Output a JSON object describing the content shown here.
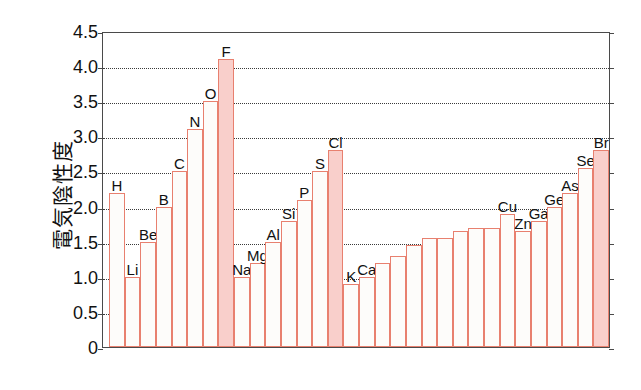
{
  "chart_data": {
    "type": "bar",
    "title": "",
    "xlabel": "",
    "ylabel": "電気陰性度",
    "ylim": [
      0,
      4.5
    ],
    "grid": true,
    "legend": "none",
    "y_ticks": [
      0,
      0.5,
      1.0,
      1.5,
      2.0,
      2.5,
      3.0,
      3.5,
      4.0,
      4.5
    ],
    "y_tick_labels": [
      "0",
      "0.5",
      "1.0",
      "1.5",
      "2.0",
      "2.5",
      "3.0",
      "3.5",
      "4.0",
      "4.5"
    ],
    "categories": [
      "H",
      "Li",
      "Be",
      "B",
      "C",
      "N",
      "O",
      "F",
      "Na",
      "Mg",
      "Al",
      "Si",
      "P",
      "S",
      "Cl",
      "K",
      "Ca",
      "Sc",
      "Ti",
      "V",
      "Cr",
      "Mn",
      "Fe",
      "Co",
      "Ni",
      "Cu",
      "Zn",
      "Ga",
      "Ge",
      "As",
      "Se",
      "Br"
    ],
    "values": [
      2.2,
      1.0,
      1.5,
      2.0,
      2.5,
      3.1,
      3.5,
      4.1,
      1.0,
      1.2,
      1.5,
      1.8,
      2.1,
      2.5,
      2.8,
      0.9,
      1.0,
      1.2,
      1.3,
      1.45,
      1.55,
      1.55,
      1.65,
      1.7,
      1.7,
      1.9,
      1.65,
      1.8,
      2.0,
      2.2,
      2.55,
      2.8
    ],
    "point_labels": [
      "H",
      "Li",
      "Be",
      "B",
      "C",
      "N",
      "O",
      "F",
      "Na",
      "Mg",
      "Al",
      "Si",
      "P",
      "S",
      "Cl",
      "K",
      "Ca",
      "",
      "",
      "",
      "",
      "",
      "",
      "",
      "",
      "Cu",
      "Zn",
      "Ga",
      "Ge",
      "As",
      "Se",
      "Br"
    ],
    "highlighted": [
      "F",
      "Cl",
      "Br"
    ],
    "colors": {
      "bar_outline": "#e8806f",
      "bar_fill": "#fdfcfa",
      "highlight_fill": "#f9cfcb",
      "axis": "#4a4a4a",
      "grid": "#3a3a3a",
      "text": "#111111"
    }
  }
}
